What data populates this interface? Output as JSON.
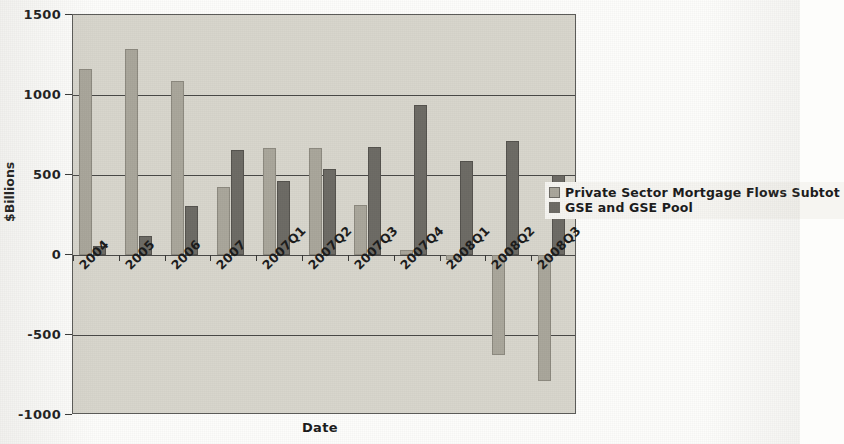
{
  "chart_data": {
    "type": "bar",
    "title": "",
    "xlabel": "Date",
    "ylabel": "$Billions",
    "ylim": [
      -1000,
      1500
    ],
    "yticks": [
      1500,
      1000,
      500,
      0,
      -500,
      -1000
    ],
    "ytick_labels": [
      "1500",
      "1000",
      "500",
      "0",
      "-500",
      "-1000"
    ],
    "grid": true,
    "grid_axis": "y",
    "legend_position": "center-right",
    "categories": [
      "2004",
      "2005",
      "2006",
      "2007",
      "2007Q1",
      "2007Q2",
      "2007Q3",
      "2007Q4",
      "2008Q1",
      "2008Q2",
      "2008Q3"
    ],
    "series": [
      {
        "name": "Private Sector Mortgage Flows Subtotal",
        "color": "#aaa79c",
        "values": [
          1163,
          1290,
          1085,
          425,
          670,
          670,
          310,
          30,
          -30,
          -625,
          -787
        ]
      },
      {
        "name": "GSE and GSE Pool",
        "color": "#6e6c66",
        "values": [
          55,
          120,
          305,
          655,
          465,
          540,
          675,
          935,
          590,
          715,
          500
        ]
      }
    ]
  },
  "legend": {
    "items": [
      {
        "label": "Private Sector Mortgage Flows Subtot",
        "swatch": "#aaa79c"
      },
      {
        "label": "GSE and GSE Pool",
        "swatch": "#6e6c66"
      }
    ]
  },
  "axes": {
    "y_title": "$Billions",
    "x_title": "Date"
  }
}
